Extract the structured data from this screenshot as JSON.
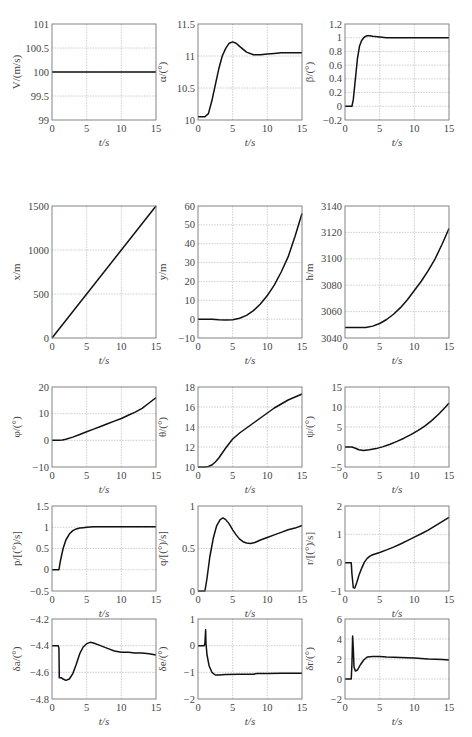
{
  "chart_data": [
    {
      "id": "V",
      "type": "line",
      "ylabel": "V/(m/s)",
      "xlabel": "t/s",
      "xlim": [
        0,
        15
      ],
      "ylim": [
        99,
        101
      ],
      "xticks": [
        0,
        5,
        10,
        15
      ],
      "yticks": [
        99,
        99.5,
        100,
        100.5,
        101
      ],
      "ytick_labels": [
        "99",
        "99.5",
        "100",
        "100.5",
        "101"
      ],
      "grid": true,
      "x": [
        0,
        15
      ],
      "y": [
        100,
        100
      ]
    },
    {
      "id": "alpha",
      "type": "line",
      "ylabel": "α/(°)",
      "xlabel": "t/s",
      "xlim": [
        0,
        15
      ],
      "ylim": [
        10,
        11.5
      ],
      "xticks": [
        0,
        5,
        10,
        15
      ],
      "yticks": [
        10,
        10.5,
        11,
        11.5
      ],
      "ytick_labels": [
        "10",
        "10.5",
        "11",
        "11.5"
      ],
      "grid": true,
      "x": [
        0,
        1,
        1.5,
        2,
        2.5,
        3,
        3.5,
        4,
        4.5,
        5,
        5.5,
        6,
        7,
        8,
        9,
        10,
        11,
        12,
        13,
        14,
        15
      ],
      "y": [
        10.05,
        10.05,
        10.1,
        10.3,
        10.55,
        10.8,
        11.0,
        11.12,
        11.2,
        11.22,
        11.2,
        11.15,
        11.06,
        11.02,
        11.02,
        11.03,
        11.04,
        11.05,
        11.05,
        11.05,
        11.05
      ]
    },
    {
      "id": "beta",
      "type": "line",
      "ylabel": "β/(°)",
      "xlabel": "t/s",
      "xlim": [
        0,
        15
      ],
      "ylim": [
        -0.2,
        1.2
      ],
      "xticks": [
        0,
        5,
        10,
        15
      ],
      "yticks": [
        -0.2,
        0,
        0.2,
        0.4,
        0.6,
        0.8,
        1,
        1.2
      ],
      "ytick_labels": [
        "-0.2",
        "0",
        "0.2",
        "0.4",
        "0.6",
        "0.8",
        "1",
        "1.2"
      ],
      "grid": true,
      "x": [
        0,
        1,
        1.2,
        1.5,
        1.8,
        2.1,
        2.4,
        2.8,
        3.2,
        3.6,
        4,
        5,
        6,
        8,
        10,
        15
      ],
      "y": [
        0,
        0,
        0.1,
        0.4,
        0.7,
        0.88,
        0.96,
        1.01,
        1.03,
        1.03,
        1.02,
        1.01,
        1.0,
        1.0,
        1.0,
        1.0
      ]
    },
    {
      "id": "x",
      "type": "line",
      "ylabel": "x/m",
      "xlabel": "t/s",
      "xlim": [
        0,
        15
      ],
      "ylim": [
        0,
        1500
      ],
      "xticks": [
        0,
        5,
        10,
        15
      ],
      "yticks": [
        0,
        500,
        1000,
        1500
      ],
      "ytick_labels": [
        "0",
        "500",
        "1000",
        "1500"
      ],
      "grid": true,
      "x": [
        0,
        15
      ],
      "y": [
        0,
        1500
      ]
    },
    {
      "id": "y",
      "type": "line",
      "ylabel": "y/m",
      "xlabel": "t/s",
      "xlim": [
        0,
        15
      ],
      "ylim": [
        -10,
        60
      ],
      "xticks": [
        0,
        5,
        10,
        15
      ],
      "yticks": [
        -10,
        0,
        10,
        20,
        30,
        40,
        50,
        60
      ],
      "ytick_labels": [
        "-10",
        "0",
        "10",
        "20",
        "30",
        "40",
        "50",
        "60"
      ],
      "grid": true,
      "x": [
        0,
        2,
        3,
        4,
        5,
        6,
        7,
        8,
        9,
        10,
        11,
        12,
        13,
        14,
        15
      ],
      "y": [
        0,
        0,
        -0.3,
        -0.5,
        -0.3,
        0.5,
        2,
        4.5,
        8,
        12.5,
        18,
        25,
        33,
        44,
        56
      ]
    },
    {
      "id": "h",
      "type": "line",
      "ylabel": "h/m",
      "xlabel": "t/s",
      "xlim": [
        0,
        15
      ],
      "ylim": [
        3040,
        3140
      ],
      "xticks": [
        0,
        5,
        10,
        15
      ],
      "yticks": [
        3040,
        3060,
        3080,
        3100,
        3120,
        3140
      ],
      "ytick_labels": [
        "3040",
        "3060",
        "3080",
        "3100",
        "3120",
        "3140"
      ],
      "grid": true,
      "x": [
        0,
        2,
        3,
        4,
        5,
        6,
        7,
        8,
        9,
        10,
        11,
        12,
        13,
        14,
        15
      ],
      "y": [
        3048,
        3048,
        3048,
        3049,
        3051,
        3054,
        3058,
        3063,
        3069,
        3076,
        3083,
        3091,
        3100,
        3111,
        3123
      ]
    },
    {
      "id": "phi",
      "type": "line",
      "ylabel": "φ/(°)",
      "xlabel": "t/s",
      "xlim": [
        0,
        15
      ],
      "ylim": [
        -10,
        20
      ],
      "xticks": [
        0,
        5,
        10,
        15
      ],
      "yticks": [
        -10,
        0,
        10,
        20
      ],
      "ytick_labels": [
        "-10",
        "0",
        "10",
        "20"
      ],
      "grid": true,
      "x": [
        0,
        1,
        1.5,
        2,
        3,
        4,
        5,
        6,
        7,
        8,
        9,
        10,
        11,
        12,
        13,
        14,
        15
      ],
      "y": [
        0,
        0,
        0.1,
        0.4,
        1.2,
        2.2,
        3.2,
        4.2,
        5.2,
        6.2,
        7.2,
        8.2,
        9.4,
        10.6,
        12.0,
        14.0,
        16.0
      ]
    },
    {
      "id": "theta",
      "type": "line",
      "ylabel": "θ/(°)",
      "xlabel": "t/s",
      "xlim": [
        0,
        15
      ],
      "ylim": [
        10,
        18
      ],
      "xticks": [
        0,
        5,
        10,
        15
      ],
      "yticks": [
        10,
        12,
        14,
        16,
        18
      ],
      "ytick_labels": [
        "10",
        "12",
        "14",
        "16",
        "18"
      ],
      "grid": true,
      "x": [
        0,
        1,
        1.5,
        2,
        2.5,
        3,
        4,
        5,
        6,
        7,
        8,
        9,
        10,
        11,
        12,
        13,
        14,
        15
      ],
      "y": [
        10,
        10,
        10.05,
        10.2,
        10.5,
        10.9,
        11.9,
        12.8,
        13.4,
        13.9,
        14.4,
        14.9,
        15.4,
        15.9,
        16.3,
        16.7,
        17.0,
        17.3
      ]
    },
    {
      "id": "psi",
      "type": "line",
      "ylabel": "ψ/(°)",
      "xlabel": "t/s",
      "xlim": [
        0,
        15
      ],
      "ylim": [
        -5,
        15
      ],
      "xticks": [
        0,
        5,
        10,
        15
      ],
      "yticks": [
        -5,
        0,
        5,
        10,
        15
      ],
      "ytick_labels": [
        "-5",
        "0",
        "5",
        "10",
        "15"
      ],
      "grid": true,
      "x": [
        0,
        1,
        1.5,
        2,
        2.7,
        3.5,
        4.5,
        5.5,
        6.5,
        7.5,
        8.5,
        9.5,
        10.5,
        11.5,
        12.5,
        13.5,
        14.5,
        15
      ],
      "y": [
        0,
        0,
        -0.3,
        -0.7,
        -0.9,
        -0.7,
        -0.4,
        0.1,
        0.7,
        1.4,
        2.2,
        3.1,
        4.1,
        5.2,
        6.6,
        8.2,
        10.0,
        11.0
      ]
    },
    {
      "id": "p",
      "type": "line",
      "ylabel": "p/[(°)/s]",
      "xlabel": "t/s",
      "xlim": [
        0,
        15
      ],
      "ylim": [
        -0.5,
        1.5
      ],
      "xticks": [
        0,
        5,
        10,
        15
      ],
      "yticks": [
        -0.5,
        0,
        0.5,
        1,
        1.5
      ],
      "ytick_labels": [
        "-0.5",
        "0",
        "0.5",
        "1",
        "1.5"
      ],
      "grid": true,
      "x": [
        0,
        1,
        1.2,
        1.6,
        2,
        2.5,
        3,
        3.5,
        4,
        4.5,
        5,
        6,
        8,
        10,
        15
      ],
      "y": [
        0,
        0,
        0.2,
        0.5,
        0.7,
        0.84,
        0.92,
        0.96,
        0.98,
        0.99,
        1.0,
        1.01,
        1.01,
        1.01,
        1.01
      ]
    },
    {
      "id": "q",
      "type": "line",
      "ylabel": "q/[(°)/s]",
      "xlabel": "t/s",
      "xlim": [
        0,
        15
      ],
      "ylim": [
        0,
        1
      ],
      "xticks": [
        0,
        5,
        10,
        15
      ],
      "yticks": [
        0,
        0.5,
        1
      ],
      "ytick_labels": [
        "0",
        "0.5",
        "1"
      ],
      "grid": true,
      "x": [
        0,
        1,
        1.3,
        1.7,
        2.2,
        2.7,
        3.2,
        3.6,
        4,
        4.5,
        5,
        5.5,
        6,
        6.5,
        7,
        7.6,
        8.2,
        9,
        10,
        11,
        12,
        13,
        14,
        15
      ],
      "y": [
        0,
        0,
        0.15,
        0.4,
        0.62,
        0.77,
        0.84,
        0.86,
        0.84,
        0.79,
        0.72,
        0.66,
        0.61,
        0.58,
        0.565,
        0.56,
        0.57,
        0.6,
        0.63,
        0.66,
        0.69,
        0.72,
        0.74,
        0.77
      ]
    },
    {
      "id": "r",
      "type": "line",
      "ylabel": "r/[(°)/s]",
      "xlabel": "t/s",
      "xlim": [
        0,
        15
      ],
      "ylim": [
        -1,
        2
      ],
      "xticks": [
        0,
        5,
        10,
        15
      ],
      "yticks": [
        -1,
        0,
        1,
        2
      ],
      "ytick_labels": [
        "-1",
        "0",
        "1",
        "2"
      ],
      "grid": true,
      "x": [
        0,
        0.9,
        1.0,
        1.2,
        1.4,
        1.7,
        2.0,
        2.4,
        2.8,
        3.2,
        3.6,
        4,
        5,
        6,
        7,
        8,
        9,
        10,
        11,
        12,
        13,
        14,
        15
      ],
      "y": [
        0,
        0,
        -0.4,
        -0.88,
        -0.9,
        -0.7,
        -0.45,
        -0.2,
        0.02,
        0.15,
        0.23,
        0.28,
        0.36,
        0.45,
        0.55,
        0.66,
        0.78,
        0.9,
        1.02,
        1.15,
        1.3,
        1.45,
        1.6
      ]
    },
    {
      "id": "delta_a",
      "type": "line",
      "ylabel": "δa/(°)",
      "xlabel": "t/s",
      "xlim": [
        0,
        15
      ],
      "ylim": [
        -4.8,
        -4.2
      ],
      "xticks": [
        0,
        5,
        10,
        15
      ],
      "yticks": [
        -4.8,
        -4.6,
        -4.4,
        -4.2
      ],
      "ytick_labels": [
        "-4.8",
        "-4.6",
        "-4.4",
        "-4.2"
      ],
      "grid": true,
      "x": [
        0,
        0.9,
        1.0,
        1.05,
        1.3,
        1.6,
        2.0,
        2.5,
        3,
        3.5,
        4,
        4.5,
        5,
        5.5,
        6,
        7,
        8,
        9,
        10,
        11,
        12,
        13,
        14,
        15
      ],
      "y": [
        -4.4,
        -4.4,
        -4.42,
        -4.64,
        -4.64,
        -4.65,
        -4.66,
        -4.65,
        -4.61,
        -4.54,
        -4.46,
        -4.41,
        -4.385,
        -4.375,
        -4.38,
        -4.4,
        -4.42,
        -4.44,
        -4.45,
        -4.45,
        -4.455,
        -4.455,
        -4.46,
        -4.47
      ]
    },
    {
      "id": "delta_e",
      "type": "line",
      "ylabel": "δe/(°)",
      "xlabel": "t/s",
      "xlim": [
        0,
        15
      ],
      "ylim": [
        -2,
        1
      ],
      "xticks": [
        0,
        5,
        10,
        15
      ],
      "yticks": [
        -2,
        -1,
        0,
        1
      ],
      "ytick_labels": [
        "-2",
        "-1",
        "0",
        "1"
      ],
      "grid": true,
      "x": [
        0,
        0.9,
        1.0,
        1.1,
        1.15,
        1.3,
        1.6,
        2.0,
        2.5,
        3,
        4,
        6,
        8,
        8.5,
        10,
        12,
        15
      ],
      "y": [
        0,
        0,
        0.1,
        0.6,
        0.1,
        -0.35,
        -0.75,
        -1.0,
        -1.1,
        -1.1,
        -1.08,
        -1.07,
        -1.07,
        -1.04,
        -1.04,
        -1.03,
        -1.03
      ]
    },
    {
      "id": "delta_r",
      "type": "line",
      "ylabel": "δr/(°)",
      "xlabel": "t/s",
      "xlim": [
        0,
        15
      ],
      "ylim": [
        -2,
        6
      ],
      "xticks": [
        0,
        5,
        10,
        15
      ],
      "yticks": [
        -2,
        0,
        2,
        4,
        6
      ],
      "ytick_labels": [
        "-2",
        "0",
        "2",
        "4",
        "6"
      ],
      "grid": true,
      "x": [
        0,
        0.9,
        1.0,
        1.1,
        1.2,
        1.3,
        1.5,
        1.8,
        2.2,
        2.7,
        3.2,
        4,
        5,
        6,
        8,
        10,
        12,
        14,
        15
      ],
      "y": [
        0,
        0,
        1.5,
        4.3,
        3.0,
        1.2,
        0.8,
        0.9,
        1.4,
        1.9,
        2.2,
        2.25,
        2.25,
        2.2,
        2.15,
        2.1,
        2.0,
        1.95,
        1.9
      ]
    }
  ]
}
